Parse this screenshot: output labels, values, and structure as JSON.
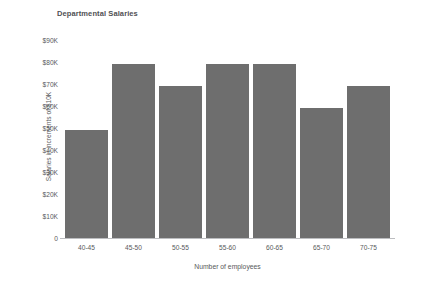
{
  "chart_data": {
    "type": "bar",
    "title": "Departmental Salaries",
    "xlabel": "Number of employees",
    "ylabel": "Salaries in increments of $10K",
    "categories": [
      "40-45",
      "45-50",
      "50-55",
      "55-60",
      "60-65",
      "65-70",
      "70-75"
    ],
    "values": [
      49000,
      79000,
      69000,
      79000,
      79000,
      59000,
      69000
    ],
    "ylim": [
      0,
      90000
    ],
    "ytick_values": [
      90000,
      80000,
      70000,
      60000,
      50000,
      40000,
      30000,
      20000,
      10000,
      0
    ],
    "ytick_labels": [
      "$90K",
      "$80K",
      "$70K",
      "$60K",
      "$50K",
      "$40K",
      "$30K",
      "$20K",
      "$10K",
      "0"
    ],
    "grid": false,
    "legend": false,
    "bar_color": "#6e6e6e",
    "axis_color": "#bcbdc0",
    "background": "#ffffff",
    "text_color": "#58595b"
  }
}
